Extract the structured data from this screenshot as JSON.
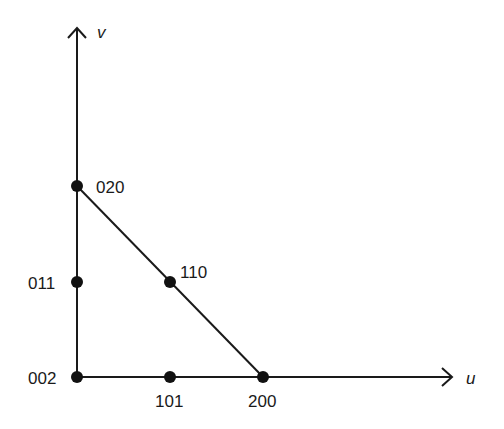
{
  "diagram": {
    "axes": {
      "x_label": "u",
      "y_label": "v"
    },
    "points": [
      {
        "id": "002",
        "label": "002",
        "u": 0,
        "v": 0
      },
      {
        "id": "101",
        "label": "101",
        "u": 1,
        "v": 0
      },
      {
        "id": "200",
        "label": "200",
        "u": 2,
        "v": 0
      },
      {
        "id": "011",
        "label": "011",
        "u": 0,
        "v": 1
      },
      {
        "id": "110",
        "label": "110",
        "u": 1,
        "v": 1
      },
      {
        "id": "020",
        "label": "020",
        "u": 0,
        "v": 2
      }
    ],
    "edges": [
      {
        "from": "020",
        "to": "200"
      }
    ],
    "colors": {
      "ink": "#1a1a1a",
      "background": "#ffffff"
    }
  }
}
